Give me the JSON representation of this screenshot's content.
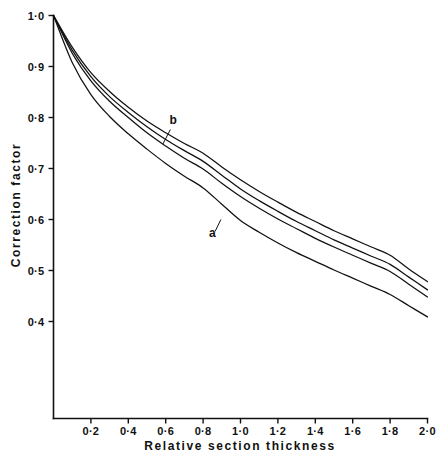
{
  "chart_data": {
    "type": "line",
    "title": "",
    "xlabel": "Relative section thickness",
    "ylabel": "Correction factor",
    "xlim": [
      0,
      2.0
    ],
    "ylim": [
      0.35,
      1.0
    ],
    "grid": false,
    "legend_position": "inline-annotations",
    "x_tick_labels": [
      "0·2",
      "0·4",
      "0·6",
      "0·8",
      "1·0",
      "1·2",
      "1·4",
      "1·6",
      "1·8",
      "2·0"
    ],
    "x_tick_values": [
      0.2,
      0.4,
      0.6,
      0.8,
      1.0,
      1.2,
      1.4,
      1.6,
      1.8,
      2.0
    ],
    "y_tick_labels": [
      "1·0",
      "0·9",
      "0·8",
      "0·7",
      "0·6",
      "0·5",
      "0·4"
    ],
    "y_tick_values": [
      1.0,
      0.9,
      0.8,
      0.7,
      0.6,
      0.5,
      0.4
    ],
    "x": [
      0.0,
      0.1,
      0.2,
      0.3,
      0.4,
      0.5,
      0.6,
      0.7,
      0.8,
      0.9,
      1.0,
      1.1,
      1.2,
      1.3,
      1.4,
      1.5,
      1.6,
      1.7,
      1.8,
      1.9,
      2.0
    ],
    "series": [
      {
        "name": "d",
        "label": "",
        "color": "#111111",
        "values": [
          1.0,
          0.938,
          0.888,
          0.851,
          0.82,
          0.793,
          0.77,
          0.749,
          0.73,
          0.703,
          0.678,
          0.655,
          0.634,
          0.614,
          0.596,
          0.578,
          0.562,
          0.546,
          0.53,
          0.503,
          0.478
        ]
      },
      {
        "name": "c",
        "label": "",
        "color": "#111111",
        "values": [
          1.0,
          0.932,
          0.88,
          0.841,
          0.81,
          0.782,
          0.757,
          0.735,
          0.714,
          0.687,
          0.66,
          0.637,
          0.616,
          0.596,
          0.578,
          0.56,
          0.544,
          0.528,
          0.512,
          0.487,
          0.462
        ]
      },
      {
        "name": "b",
        "label": "b",
        "color": "#111111",
        "values": [
          1.0,
          0.926,
          0.872,
          0.832,
          0.8,
          0.77,
          0.744,
          0.72,
          0.699,
          0.671,
          0.645,
          0.622,
          0.601,
          0.582,
          0.563,
          0.546,
          0.53,
          0.514,
          0.498,
          0.473,
          0.448
        ]
      },
      {
        "name": "a",
        "label": "a",
        "color": "#111111",
        "values": [
          1.0,
          0.908,
          0.845,
          0.802,
          0.768,
          0.738,
          0.71,
          0.685,
          0.662,
          0.63,
          0.598,
          0.575,
          0.554,
          0.535,
          0.518,
          0.501,
          0.485,
          0.469,
          0.453,
          0.431,
          0.409
        ]
      }
    ],
    "annotations": [
      {
        "text": "b",
        "x": 0.64,
        "y": 0.787,
        "points_to_x": 0.585,
        "points_to_y": 0.748
      },
      {
        "text": "a",
        "x": 0.85,
        "y": 0.566,
        "points_to_x": 0.895,
        "points_to_y": 0.6
      }
    ]
  }
}
